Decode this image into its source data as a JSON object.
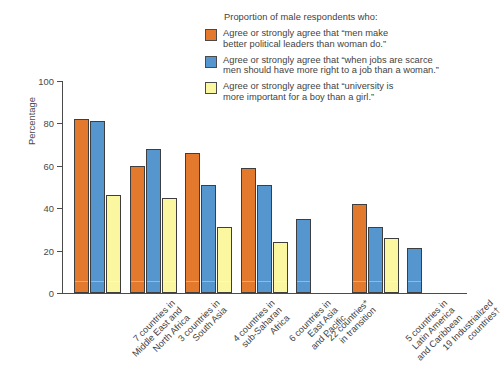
{
  "chart_data": {
    "type": "bar",
    "title": "",
    "xlabel": "",
    "ylabel": "Percentage",
    "ylim": [
      0,
      100
    ],
    "yticks": [
      0,
      20,
      40,
      60,
      80,
      100
    ],
    "grid": false,
    "legend_position": "top-right",
    "legend_title": "Proportion of male respondents who:",
    "categories": [
      "7 countries in Middle East and North Africa",
      "3 countries in South Asia",
      "4 countries in sub-Saharan Africa",
      "6 countries in East Asia and Pacific",
      "22 countries* in transition",
      "5 countries in Latin America and Caribbean",
      "19 Industrialized countries†"
    ],
    "category_lines": [
      [
        "7 countries in",
        "Middle East and",
        "North Africa"
      ],
      [
        "3 countries in",
        "South Asia"
      ],
      [
        "4 countries in",
        "sub-Saharan",
        "Africa"
      ],
      [
        "6 countries in",
        "East Asia",
        "and Pacific"
      ],
      [
        "22 countries*",
        "in transition"
      ],
      [
        "5 countries in",
        "Latin America",
        "and Caribbean"
      ],
      [
        "19 Industrialized",
        "countries†"
      ]
    ],
    "series": [
      {
        "name": "Agree or strongly agree that \"men make better political leaders than woman do.\"",
        "name_lines": [
          "Agree or strongly agree that “men make",
          "better political leaders than woman do.”"
        ],
        "color": "#e2792c",
        "values": [
          82,
          60,
          66,
          59,
          null,
          42,
          null
        ]
      },
      {
        "name": "Agree or strongly agree that \"when jobs are scarce men should have more right to a job than a woman.\"",
        "name_lines": [
          "Agree or strongly agree that “when jobs are scarce",
          "men should have more right to a job than a woman.”"
        ],
        "color": "#5496cd",
        "values": [
          81,
          68,
          51,
          51,
          35,
          31,
          21
        ]
      },
      {
        "name": "Agree or strongly agree that \"university is more important for a boy than a girl.\"",
        "name_lines": [
          "Agree or strongly agree that “university is",
          "more important for a boy than a girl.”"
        ],
        "color": "#fbf7a0",
        "values": [
          46,
          45,
          31,
          24,
          null,
          26,
          null
        ]
      }
    ]
  }
}
